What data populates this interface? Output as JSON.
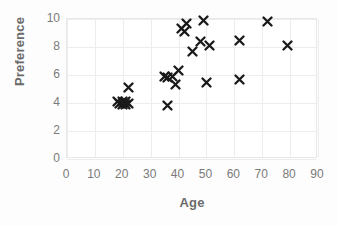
{
  "chart_data": {
    "type": "scatter",
    "title": "",
    "xlabel": "Age",
    "ylabel": "Preference",
    "xlim": [
      0,
      90
    ],
    "ylim": [
      0,
      10
    ],
    "xticks": [
      0,
      10,
      20,
      30,
      40,
      50,
      60,
      70,
      80,
      90
    ],
    "yticks": [
      0,
      2,
      4,
      6,
      8,
      10
    ],
    "xtick_labels": [
      "0",
      "10",
      "20",
      "30",
      "40",
      "50",
      "60",
      "70",
      "80",
      "90"
    ],
    "ytick_labels": [
      "0",
      "2",
      "4",
      "6",
      "8",
      "10"
    ],
    "grid": true,
    "legend": false,
    "legend_position": "none",
    "marker_symbol": "x",
    "marker_color": "#1a1a1a",
    "series": [
      {
        "name": "Age vs Preference",
        "points": [
          [
            18,
            4.1
          ],
          [
            19,
            4.0
          ],
          [
            20,
            4.1
          ],
          [
            20,
            3.9
          ],
          [
            21,
            4.1
          ],
          [
            21,
            3.9
          ],
          [
            22,
            4.0
          ],
          [
            22,
            5.1
          ],
          [
            36,
            3.8
          ],
          [
            35,
            5.9
          ],
          [
            36,
            5.8
          ],
          [
            38,
            5.9
          ],
          [
            39,
            5.3
          ],
          [
            40,
            6.3
          ],
          [
            41,
            9.3
          ],
          [
            42,
            9.1
          ],
          [
            43,
            9.7
          ],
          [
            45,
            7.7
          ],
          [
            48,
            8.4
          ],
          [
            49,
            9.9
          ],
          [
            51,
            8.1
          ],
          [
            50,
            5.5
          ],
          [
            62,
            8.5
          ],
          [
            62,
            5.7
          ],
          [
            72,
            9.8
          ],
          [
            79,
            8.1
          ]
        ]
      }
    ]
  },
  "style": {
    "background_color": "#fdfdfd",
    "plot_background_color": "#ffffff",
    "gridline_color": "#ededed",
    "axis_title_color": "#6b6b6b",
    "tick_label_color": "#7a7a7a",
    "marker_color": "#1a1a1a"
  }
}
